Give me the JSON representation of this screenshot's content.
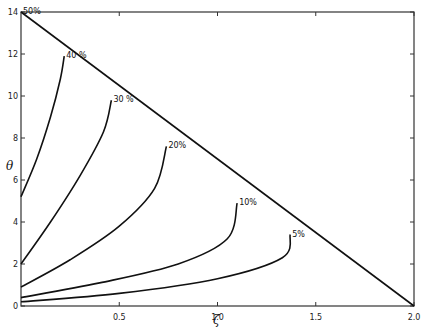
{
  "chart_data": {
    "type": "line",
    "title": "",
    "xlabel": "ζ",
    "ylabel": "θ",
    "xlim": [
      0,
      2.0
    ],
    "ylim": [
      0,
      14
    ],
    "grid": false,
    "x_ticks": [
      "0.5",
      "1.0",
      "1.5",
      "2.0"
    ],
    "x_tick_values": [
      0.5,
      1.0,
      1.5,
      2.0
    ],
    "y_ticks": [
      "0",
      "2",
      "4",
      "6",
      "8",
      "10",
      "12",
      "14"
    ],
    "y_tick_values": [
      0,
      2,
      4,
      6,
      8,
      10,
      12,
      14
    ],
    "boundary_line": {
      "name": "envelope",
      "points": [
        [
          0,
          14
        ],
        [
          2.0,
          0
        ]
      ]
    },
    "series": [
      {
        "name": "50%",
        "label": "50%",
        "points": [
          [
            0,
            14
          ]
        ]
      },
      {
        "name": "40%",
        "label": "40 %",
        "points": [
          [
            0,
            5.2
          ],
          [
            0.08,
            7.0
          ],
          [
            0.15,
            9.0
          ],
          [
            0.2,
            10.8
          ],
          [
            0.22,
            11.9
          ]
        ]
      },
      {
        "name": "30%",
        "label": "30 %",
        "points": [
          [
            0,
            2.0
          ],
          [
            0.15,
            4.0
          ],
          [
            0.3,
            6.2
          ],
          [
            0.42,
            8.3
          ],
          [
            0.46,
            9.8
          ]
        ]
      },
      {
        "name": "20%",
        "label": "20%",
        "points": [
          [
            0,
            0.9
          ],
          [
            0.25,
            2.2
          ],
          [
            0.5,
            3.8
          ],
          [
            0.68,
            5.6
          ],
          [
            0.74,
            7.6
          ]
        ]
      },
      {
        "name": "10%",
        "label": "10%",
        "points": [
          [
            0,
            0.4
          ],
          [
            0.4,
            1.1
          ],
          [
            0.8,
            2.0
          ],
          [
            1.05,
            3.2
          ],
          [
            1.1,
            4.9
          ]
        ]
      },
      {
        "name": "5%",
        "label": "5%",
        "points": [
          [
            0,
            0.2
          ],
          [
            0.5,
            0.6
          ],
          [
            1.0,
            1.3
          ],
          [
            1.33,
            2.3
          ],
          [
            1.37,
            3.4
          ]
        ]
      }
    ]
  }
}
